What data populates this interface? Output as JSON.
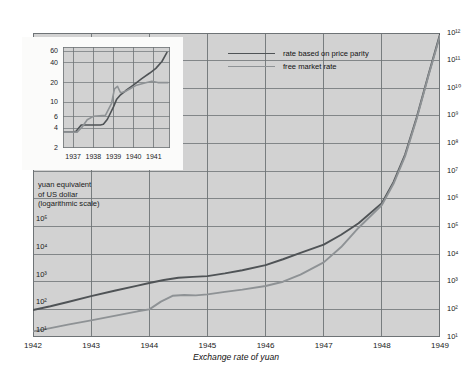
{
  "chart_data": {
    "type": "line",
    "title": "Exchange rate of yuan",
    "ylabel": "yuan equivalent of US dollar (logarithmic scale)",
    "ylabel_lines": [
      "yuan equivalent",
      "of US dollar",
      "(logarithmic scale)"
    ],
    "xlabel": "",
    "grid": true,
    "legend_position": "top-right",
    "y_scale": "log",
    "ylim": [
      10,
      1000000000000
    ],
    "xlim": [
      1942,
      1949
    ],
    "y_ticks_left": [
      "10¹",
      "10²",
      "10³",
      "10⁴",
      "10⁵"
    ],
    "y_ticks_right": [
      "10¹",
      "10²",
      "10³",
      "10⁴",
      "10⁵",
      "10⁶",
      "10⁷",
      "10⁸",
      "10⁹",
      "10¹⁰",
      "10¹¹",
      "10¹²"
    ],
    "x_ticks": [
      "1942",
      "1943",
      "1944",
      "1945",
      "1946",
      "1947",
      "1948",
      "1949"
    ],
    "series": [
      {
        "name": "rate based on price parity",
        "color": "#4f5356",
        "x": [
          1942.0,
          1942.3,
          1942.6,
          1943.0,
          1943.4,
          1943.8,
          1944.0,
          1944.25,
          1944.5,
          1944.75,
          1945.0,
          1945.3,
          1945.6,
          1946.0,
          1946.3,
          1946.6,
          1947.0,
          1947.3,
          1947.6,
          1948.0,
          1948.2,
          1948.4,
          1948.6,
          1948.8,
          1949.0
        ],
        "values": [
          95,
          130,
          185,
          300,
          470,
          720,
          900,
          1150,
          1400,
          1500,
          1600,
          2000,
          2600,
          4000,
          6500,
          11000,
          22000,
          50000,
          130000,
          700000,
          4000000,
          40000000,
          900000000,
          30000000000,
          900000000000
        ]
      },
      {
        "name": "free market rate",
        "color": "#8e9295",
        "x": [
          1942.0,
          1942.3,
          1942.6,
          1943.0,
          1943.4,
          1943.8,
          1944.0,
          1944.2,
          1944.4,
          1944.6,
          1944.8,
          1945.0,
          1945.3,
          1945.6,
          1946.0,
          1946.3,
          1946.6,
          1947.0,
          1947.3,
          1947.6,
          1948.0,
          1948.2,
          1948.4,
          1948.6,
          1948.8,
          1949.0
        ],
        "values": [
          16,
          21,
          28,
          40,
          58,
          85,
          100,
          190,
          310,
          330,
          320,
          350,
          430,
          520,
          700,
          1000,
          1800,
          5000,
          18000,
          90000,
          600000,
          3500000,
          35000000,
          800000000,
          28000000000,
          800000000000
        ]
      }
    ],
    "inset": {
      "type": "line",
      "y_scale": "log",
      "ylim": [
        2,
        70
      ],
      "xlim": [
        1936.5,
        1941.8
      ],
      "y_ticks": [
        "60",
        "40",
        "20",
        "10",
        "6",
        "4",
        "2"
      ],
      "y_tick_values": [
        60,
        40,
        20,
        10,
        6,
        4,
        2
      ],
      "x_ticks": [
        "1937",
        "1938",
        "1939",
        "1940",
        "1941"
      ],
      "series": [
        {
          "name": "rate based on price parity",
          "color": "#4f5356",
          "x": [
            1936.55,
            1937.0,
            1937.15,
            1937.4,
            1937.6,
            1938.0,
            1938.35,
            1938.5,
            1938.7,
            1939.0,
            1939.15,
            1939.35,
            1939.6,
            1940.0,
            1940.4,
            1940.8,
            1941.1,
            1941.4,
            1941.65
          ],
          "values": [
            3.5,
            3.5,
            3.6,
            4.5,
            4.5,
            4.5,
            4.5,
            4.6,
            5.5,
            8.5,
            11.0,
            13.0,
            15.0,
            18.5,
            23.0,
            28.0,
            33.0,
            42.0,
            58.0
          ]
        },
        {
          "name": "free market rate",
          "color": "#8e9295",
          "x": [
            1936.55,
            1937.0,
            1937.2,
            1937.45,
            1937.7,
            1938.0,
            1938.3,
            1938.6,
            1938.9,
            1939.05,
            1939.2,
            1939.35,
            1939.55,
            1939.8,
            1940.1,
            1940.5,
            1940.9,
            1941.2,
            1941.5,
            1941.7
          ],
          "values": [
            3.5,
            3.5,
            3.5,
            4.2,
            5.4,
            6.1,
            6.2,
            6.3,
            9.5,
            16.0,
            17.5,
            14.0,
            14.5,
            16.0,
            18.0,
            19.5,
            21.0,
            20.0,
            20.0,
            20.0
          ]
        }
      ]
    }
  },
  "legend": {
    "items": [
      {
        "label": "rate based on price parity",
        "color": "#4f5356"
      },
      {
        "label": "free market rate",
        "color": "#8e9295"
      }
    ]
  },
  "colors": {
    "plot_background": "#d2d2d2",
    "grid": "#6e7376",
    "page_background": "#ffffff",
    "inset_card": "#fbfbfa",
    "price_parity": "#4f5356",
    "free_market": "#8e9295"
  }
}
